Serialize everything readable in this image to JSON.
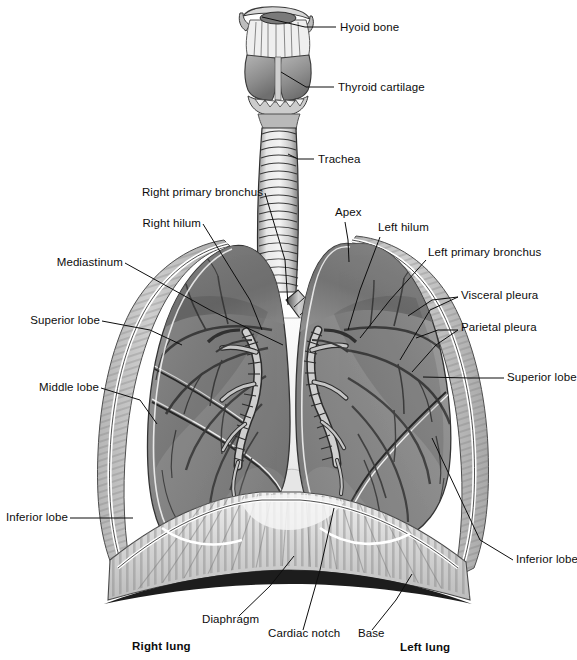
{
  "figure": {
    "background_color": "#ffffff",
    "width": 577,
    "height": 660,
    "ink_color": "#0d0d0d"
  },
  "labels": [
    {
      "id": "hyoid-bone",
      "text": "Hyoid bone",
      "x": 340,
      "y": 31,
      "align": "start",
      "bold": false,
      "leader": [
        [
          336,
          27
        ],
        [
          305,
          27
        ],
        [
          262,
          17
        ]
      ]
    },
    {
      "id": "thyroid-cartilage",
      "text": "Thyroid cartilage",
      "x": 338,
      "y": 91,
      "align": "start",
      "bold": false,
      "leader": [
        [
          334,
          87
        ],
        [
          306,
          87
        ],
        [
          281,
          72
        ]
      ]
    },
    {
      "id": "trachea",
      "text": "Trachea",
      "x": 318,
      "y": 163,
      "align": "start",
      "bold": false,
      "leader": [
        [
          314,
          159
        ],
        [
          298,
          159
        ],
        [
          288,
          154
        ]
      ]
    },
    {
      "id": "right-primary-bronchus",
      "text": "Right primary bronchus",
      "x": 263,
      "y": 196,
      "align": "end",
      "bold": false,
      "leader": [
        [
          265,
          193
        ],
        [
          285,
          260
        ],
        [
          288,
          305
        ]
      ]
    },
    {
      "id": "right-hilum",
      "text": "Right hilum",
      "x": 201,
      "y": 227,
      "align": "end",
      "bold": false,
      "leader": [
        [
          203,
          224
        ],
        [
          250,
          300
        ],
        [
          262,
          330
        ]
      ]
    },
    {
      "id": "mediastinum",
      "text": "Mediastinum",
      "x": 123,
      "y": 266,
      "align": "end",
      "bold": false,
      "leader": [
        [
          125,
          263
        ],
        [
          210,
          310
        ],
        [
          283,
          345
        ]
      ]
    },
    {
      "id": "superior-lobe-right",
      "text": "Superior lobe",
      "x": 100,
      "y": 324,
      "align": "end",
      "bold": false,
      "leader": [
        [
          102,
          321
        ],
        [
          150,
          330
        ],
        [
          182,
          345
        ]
      ]
    },
    {
      "id": "middle-lobe",
      "text": "Middle lobe",
      "x": 99,
      "y": 391,
      "align": "end",
      "bold": false,
      "leader": [
        [
          101,
          388
        ],
        [
          140,
          400
        ],
        [
          157,
          424
        ]
      ]
    },
    {
      "id": "inferior-lobe-right",
      "text": "Inferior lobe",
      "x": 68,
      "y": 521,
      "align": "end",
      "bold": false,
      "leader": [
        [
          70,
          518
        ],
        [
          108,
          518
        ],
        [
          133,
          518
        ]
      ]
    },
    {
      "id": "apex",
      "text": "Apex",
      "x": 335,
      "y": 216,
      "align": "start",
      "bold": false,
      "leader": [
        [
          345,
          222
        ],
        [
          348,
          240
        ],
        [
          349,
          262
        ]
      ]
    },
    {
      "id": "left-hilum",
      "text": "Left hilum",
      "x": 378,
      "y": 231,
      "align": "start",
      "bold": false,
      "leader": [
        [
          380,
          237
        ],
        [
          360,
          290
        ],
        [
          348,
          330
        ]
      ]
    },
    {
      "id": "left-primary-bronchus",
      "text": "Left primary bronchus",
      "x": 428,
      "y": 256,
      "align": "start",
      "bold": false,
      "leader": [
        [
          426,
          260
        ],
        [
          390,
          300
        ],
        [
          360,
          338
        ]
      ]
    },
    {
      "id": "visceral-pleura",
      "text": "Visceral pleura",
      "x": 461,
      "y": 299,
      "align": "start",
      "bold": false,
      "leader": [
        [
          458,
          297
        ],
        [
          432,
          300
        ],
        [
          408,
          316
        ]
      ]
    },
    {
      "id": "visceral-pleura-b",
      "text": "",
      "x": 0,
      "y": 0,
      "align": "start",
      "bold": false,
      "leader": [
        [
          458,
          297
        ],
        [
          430,
          310
        ],
        [
          400,
          360
        ]
      ]
    },
    {
      "id": "parietal-pleura",
      "text": "Parietal pleura",
      "x": 461,
      "y": 331,
      "align": "start",
      "bold": false,
      "leader": [
        [
          458,
          330
        ],
        [
          438,
          330
        ],
        [
          416,
          338
        ]
      ]
    },
    {
      "id": "parietal-pleura-b",
      "text": "",
      "x": 0,
      "y": 0,
      "align": "start",
      "bold": false,
      "leader": [
        [
          458,
          330
        ],
        [
          436,
          345
        ],
        [
          412,
          372
        ]
      ]
    },
    {
      "id": "superior-lobe-left",
      "text": "Superior lobe",
      "x": 507,
      "y": 381,
      "align": "start",
      "bold": false,
      "leader": [
        [
          504,
          378
        ],
        [
          470,
          378
        ],
        [
          423,
          377
        ]
      ]
    },
    {
      "id": "inferior-lobe-left",
      "text": "Inferior lobe",
      "x": 516,
      "y": 563,
      "align": "start",
      "bold": false,
      "leader": [
        [
          513,
          560
        ],
        [
          480,
          540
        ],
        [
          432,
          438
        ]
      ]
    },
    {
      "id": "diaphragm",
      "text": "Diaphragm",
      "x": 202,
      "y": 623,
      "align": "start",
      "bold": false,
      "leader": [
        [
          239,
          616
        ],
        [
          270,
          586
        ],
        [
          294,
          556
        ]
      ]
    },
    {
      "id": "cardiac-notch",
      "text": "Cardiac notch",
      "x": 268,
      "y": 637,
      "align": "start",
      "bold": false,
      "leader": [
        [
          303,
          630
        ],
        [
          320,
          570
        ],
        [
          334,
          508
        ]
      ]
    },
    {
      "id": "base",
      "text": "Base",
      "x": 358,
      "y": 637,
      "align": "start",
      "bold": false,
      "leader": [
        [
          372,
          630
        ],
        [
          396,
          600
        ],
        [
          412,
          574
        ]
      ]
    },
    {
      "id": "right-lung",
      "text": "Right lung",
      "x": 132,
      "y": 650,
      "align": "start",
      "bold": true,
      "leader": []
    },
    {
      "id": "left-lung",
      "text": "Left lung",
      "x": 400,
      "y": 651,
      "align": "start",
      "bold": true,
      "leader": []
    }
  ]
}
